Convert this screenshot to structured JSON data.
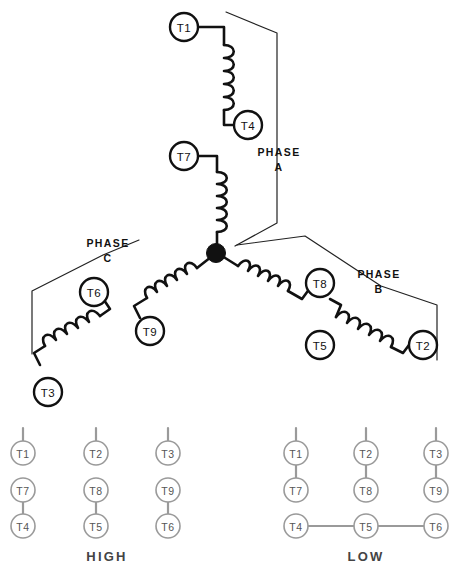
{
  "diagram": {
    "title_absent": true,
    "type": "three-phase-wye-winding",
    "phases": [
      {
        "id": "A",
        "label_line1": "PHASE",
        "label_line2": "A",
        "coils": [
          "T1-T4",
          "T7-neutral"
        ]
      },
      {
        "id": "B",
        "label_line1": "PHASE",
        "label_line2": "B",
        "coils": [
          "T5-T2",
          "T8-neutral"
        ]
      },
      {
        "id": "C",
        "label_line1": "PHASE",
        "label_line2": "C",
        "coils": [
          "T3-T6",
          "T9-neutral"
        ]
      }
    ],
    "terminals": {
      "t1": "T1",
      "t2": "T2",
      "t3": "T3",
      "t4": "T4",
      "t5": "T5",
      "t6": "T6",
      "t7": "T7",
      "t8": "T8",
      "t9": "T9"
    },
    "neutral_node": "wye-center-junction"
  },
  "connection_tables": {
    "high": {
      "title": "HIGH",
      "line_leads": [
        "T1",
        "T2",
        "T3"
      ],
      "rows": [
        [
          "T1",
          "T2",
          "T3"
        ],
        [
          "T7",
          "T8",
          "T9"
        ],
        [
          "T4",
          "T5",
          "T6"
        ]
      ],
      "joins": [
        "T7-T4",
        "T8-T5",
        "T9-T6"
      ],
      "open_gaps": [
        "T1-T7",
        "T2-T8",
        "T3-T9"
      ]
    },
    "low": {
      "title": "LOW",
      "line_leads": [
        "T1",
        "T2",
        "T3"
      ],
      "rows": [
        [
          "T1",
          "T2",
          "T3"
        ],
        [
          "T7",
          "T8",
          "T9"
        ],
        [
          "T4",
          "T5",
          "T6"
        ]
      ],
      "joins": [
        "T1-T7",
        "T2-T8",
        "T3-T9",
        "T4-T5",
        "T5-T6"
      ],
      "open_gaps": [
        "T7-T4",
        "T8-T5",
        "T9-T6"
      ]
    }
  },
  "colors": {
    "ink": "#111111",
    "bracket": "#222222",
    "table_gray": "#9a9a9a",
    "background": "#ffffff"
  }
}
